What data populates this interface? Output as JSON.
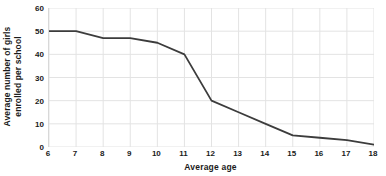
{
  "chart_data": {
    "type": "line",
    "title": "",
    "xlabel": "Average age",
    "ylabel": "Average number of girls enrolled per school",
    "ylabel_line1": "Average number of girls",
    "ylabel_line2": "enrolled per school",
    "x": [
      6,
      7,
      8,
      9,
      10,
      11,
      12,
      13,
      14,
      15,
      16,
      17,
      18
    ],
    "values": [
      50,
      50,
      47,
      47,
      45,
      40,
      20,
      15,
      10,
      5,
      4,
      3,
      1
    ],
    "categories": [
      "6",
      "7",
      "8",
      "9",
      "10",
      "11",
      "12",
      "13",
      "14",
      "15",
      "16",
      "17",
      "18"
    ],
    "xtick_labels": [
      "6",
      "7",
      "8",
      "9",
      "10",
      "11",
      "12",
      "13",
      "14",
      "15",
      "16",
      "17",
      "18"
    ],
    "ytick_labels": [
      "0",
      "10",
      "20",
      "30",
      "40",
      "50",
      "60"
    ],
    "yticks": [
      0,
      10,
      20,
      30,
      40,
      50,
      60
    ],
    "xlim": [
      6,
      18
    ],
    "ylim": [
      0,
      60
    ],
    "grid": true,
    "grid_color": "#e3e3e3",
    "line_color": "#3c3c3c",
    "line_width": 1.8,
    "legend": "none",
    "background": "#ffffff"
  }
}
